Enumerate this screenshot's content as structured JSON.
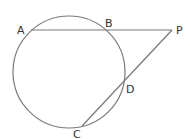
{
  "diagram": {
    "type": "circle-secants",
    "colors": {
      "stroke": "#7a7a7a",
      "label": "#333333",
      "background": "#ffffff"
    },
    "circle": {
      "cx": 69,
      "cy": 72,
      "r": 56
    },
    "points": {
      "A": {
        "label": "A",
        "x": 31,
        "y": 30,
        "lx": 17,
        "ly": 34
      },
      "B": {
        "label": "B",
        "x": 105,
        "y": 30,
        "lx": 105,
        "ly": 27
      },
      "P": {
        "label": "P",
        "x": 172,
        "y": 30,
        "lx": 176,
        "ly": 34
      },
      "D": {
        "label": "D",
        "x": 125,
        "y": 80,
        "lx": 126,
        "ly": 93
      },
      "C": {
        "label": "C",
        "x": 82,
        "y": 126,
        "lx": 73,
        "ly": 138
      }
    },
    "segments": [
      {
        "from": "A",
        "to": "P"
      },
      {
        "from": "C",
        "to": "P"
      }
    ]
  }
}
